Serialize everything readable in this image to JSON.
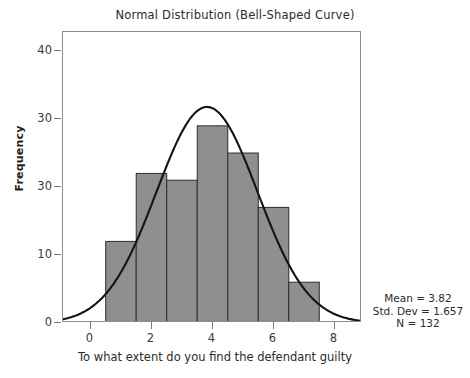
{
  "top_clipped_caption": "",
  "chart_data": {
    "type": "bar",
    "title": "Normal Distribution (Bell-Shaped Curve)",
    "subtitle": "",
    "xlabel": "To what extent do you find the defendant guilty",
    "ylabel": "Frequency",
    "grid": false,
    "legend": null,
    "xlim": [
      -0.9,
      8.9
    ],
    "ylim": [
      0,
      42.8
    ],
    "x_ticks": [
      "0",
      "2",
      "4",
      "6",
      "8"
    ],
    "x_tick_values": [
      0,
      2,
      4,
      6,
      8
    ],
    "y_ticks": [
      "40",
      "30",
      "30",
      "10",
      "0"
    ],
    "y_tick_values": [
      40,
      30,
      20,
      10,
      0
    ],
    "categories": [
      "0.5-1.5",
      "1.5-2.5",
      "2.5-3.5",
      "3.5-4.5",
      "4.5-5.5",
      "5.5-6.5",
      "6.5-7.5"
    ],
    "bin_edges": [
      0.5,
      1.5,
      2.5,
      3.5,
      4.5,
      5.5,
      6.5,
      7.5
    ],
    "bin_centers": [
      1,
      2,
      3,
      4,
      5,
      6,
      7
    ],
    "values": [
      12,
      22,
      21,
      29,
      25,
      17,
      6
    ],
    "bar_color": "#8f8f8f",
    "bar_edge_color": "#2e2e2e",
    "overlay": {
      "type": "line",
      "name": "normal-curve",
      "color": "#141414",
      "mean": 3.82,
      "std_dev": 1.657,
      "n": 132,
      "bin_width": 1,
      "peak_value": 31.8
    },
    "annotations": [
      "Mean = 3.82",
      "Std. Dev = 1.657",
      "N = 132"
    ]
  },
  "stats": {
    "mean_line": "Mean = 3.82",
    "std_dev_line": "Std. Dev = 1.657",
    "n_line": "N = 132"
  }
}
